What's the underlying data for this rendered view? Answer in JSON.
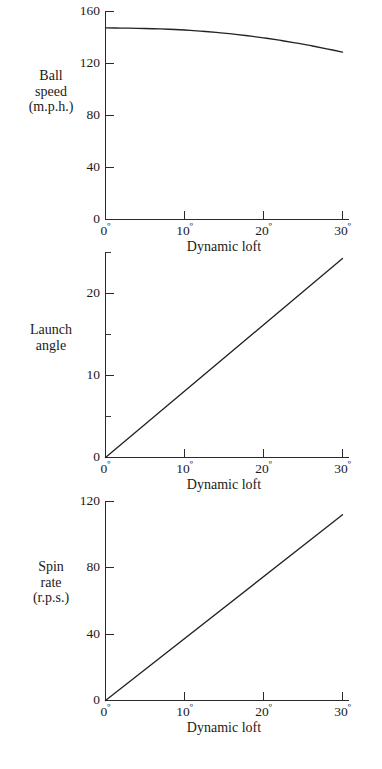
{
  "figure": {
    "background": "#ffffff",
    "ink_color": "#232323"
  },
  "panels": [
    {
      "id": "ball-speed",
      "y_title_lines": [
        "Ball",
        "speed",
        "(m.p.h.)"
      ],
      "x_title": "Dynamic loft",
      "y_ticks": [
        "0",
        "40",
        "80",
        "120",
        "160"
      ],
      "x_ticks": [
        "0",
        "10",
        "20",
        "30"
      ],
      "degree_symbol": "º"
    },
    {
      "id": "launch-angle",
      "y_title_lines": [
        "Launch",
        "angle"
      ],
      "x_title": "Dynamic loft",
      "y_ticks": [
        "0",
        "10",
        "20"
      ],
      "x_ticks": [
        "0",
        "10",
        "20",
        "30"
      ],
      "degree_symbol": "º"
    },
    {
      "id": "spin-rate",
      "y_title_lines": [
        "Spin",
        "rate",
        "(r.p.s.)"
      ],
      "x_title": "Dynamic loft",
      "y_ticks": [
        "0",
        "40",
        "80",
        "120"
      ],
      "x_ticks": [
        "0",
        "10",
        "20",
        "30"
      ],
      "degree_symbol": "º"
    }
  ],
  "chart_data": [
    {
      "type": "line",
      "title": "",
      "panel": "ball-speed",
      "xlabel": "Dynamic loft",
      "ylabel": "Ball speed (m.p.h.)",
      "x_unit": "degrees",
      "y_unit": "m.p.h.",
      "xlim": [
        0,
        30
      ],
      "ylim": [
        0,
        160
      ],
      "xticks": [
        0,
        10,
        20,
        30
      ],
      "xticklabels": [
        "0º",
        "10º",
        "20º",
        "30º"
      ],
      "yticks": [
        0,
        40,
        80,
        120,
        160
      ],
      "yticklabels": [
        "0",
        "40",
        "80",
        "120",
        "160"
      ],
      "minor_yticks": [],
      "grid": false,
      "legend": false,
      "series": [
        {
          "name": "Ball speed",
          "x": [
            0,
            2,
            4,
            6,
            8,
            10,
            12,
            14,
            16,
            18,
            20,
            22,
            24,
            26,
            28,
            30
          ],
          "values": [
            147.0,
            146.9,
            146.7,
            146.4,
            146.0,
            145.4,
            144.6,
            143.6,
            142.4,
            141.0,
            139.4,
            137.6,
            135.6,
            133.4,
            131.0,
            128.4
          ]
        }
      ]
    },
    {
      "type": "line",
      "title": "",
      "panel": "launch-angle",
      "xlabel": "Dynamic loft",
      "ylabel": "Launch angle",
      "x_unit": "degrees",
      "y_unit": "degrees",
      "xlim": [
        0,
        30
      ],
      "ylim": [
        0,
        25
      ],
      "xticks": [
        0,
        10,
        20,
        30
      ],
      "xticklabels": [
        "0º",
        "10º",
        "20º",
        "30º"
      ],
      "yticks": [
        0,
        10,
        20
      ],
      "yticklabels": [
        "0",
        "10",
        "20"
      ],
      "minor_yticks": [
        5,
        15,
        25
      ],
      "grid": false,
      "legend": false,
      "series": [
        {
          "name": "Launch angle",
          "x": [
            0,
            30
          ],
          "values": [
            0,
            24.2
          ]
        }
      ]
    },
    {
      "type": "line",
      "title": "",
      "panel": "spin-rate",
      "xlabel": "Dynamic loft",
      "ylabel": "Spin rate (r.p.s.)",
      "x_unit": "degrees",
      "y_unit": "r.p.s.",
      "xlim": [
        0,
        30
      ],
      "ylim": [
        0,
        120
      ],
      "xticks": [
        0,
        10,
        20,
        30
      ],
      "xticklabels": [
        "0º",
        "10º",
        "20º",
        "30º"
      ],
      "yticks": [
        0,
        40,
        80,
        120
      ],
      "yticklabels": [
        "0",
        "40",
        "80",
        "120"
      ],
      "minor_yticks": [],
      "grid": false,
      "legend": false,
      "series": [
        {
          "name": "Spin rate",
          "x": [
            0,
            30
          ],
          "values": [
            0,
            112
          ]
        }
      ]
    }
  ]
}
